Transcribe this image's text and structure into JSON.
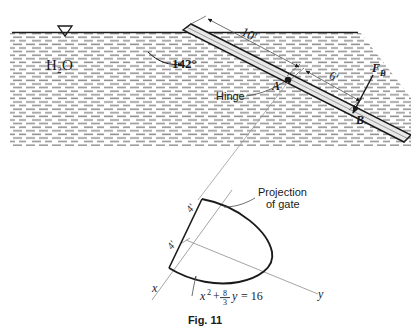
{
  "figure": {
    "caption": "Fig. 11",
    "fluid_label": "H₂O",
    "angle_label": "142°",
    "dimension_gate_top": "10'",
    "dimension_gate_bottom": "6'",
    "hinge_label": "Hinge",
    "point_a_label": "A",
    "point_b_label": "B",
    "force_label": "F",
    "force_subscript": "B",
    "projection_label_line1": "Projection",
    "projection_label_line2": "of gate",
    "axis_x_label": "x",
    "axis_y_label": "y",
    "parabola_equation_x": "x",
    "parabola_equation_exponent": "2",
    "parabola_equation_plus": "+",
    "parabola_equation_numerator": "8",
    "parabola_equation_denominator": "3",
    "parabola_equation_var": "y",
    "parabola_equation_rhs": "= 16",
    "projection_dim_upper": "4'",
    "projection_dim_lower": "4'",
    "water_surface_marker": "free-surface-triangle"
  },
  "colors": {
    "ink": "#1a1a1a",
    "gate_fill": "#e8e8e8",
    "water_hatch": "#8f8f8f",
    "leader": "#4a4a4a",
    "thin_line": "#9a9a9a",
    "background": "#ffffff"
  }
}
